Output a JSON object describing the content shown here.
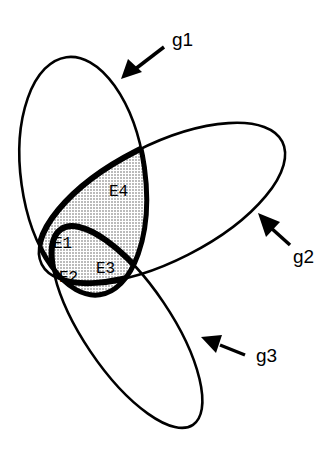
{
  "diagram": {
    "type": "set-overlap",
    "sets": [
      {
        "id": "g1",
        "label": "g1"
      },
      {
        "id": "g2",
        "label": "g2"
      },
      {
        "id": "g3",
        "label": "g3"
      }
    ],
    "regions": [
      {
        "id": "E1",
        "label": "E1"
      },
      {
        "id": "E2",
        "label": "E2"
      },
      {
        "id": "E3",
        "label": "E3"
      },
      {
        "id": "E4",
        "label": "E4"
      }
    ],
    "colors": {
      "stroke": "#000000",
      "shade": "#c8c8c8",
      "background": "#ffffff"
    }
  }
}
